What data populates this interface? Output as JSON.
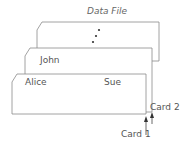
{
  "diagram": {
    "title": "Data File",
    "ellipsis": "⋮",
    "cards": [
      {
        "id": "back",
        "label": ""
      },
      {
        "id": "middle",
        "label": "John"
      },
      {
        "id": "front",
        "label_left": "Alice",
        "label_right": "Sue"
      }
    ],
    "pointers": [
      {
        "label": "Card 2"
      },
      {
        "label": "Card 1"
      }
    ],
    "colors": {
      "stroke": "#8a8a8a",
      "text": "#555555"
    }
  }
}
